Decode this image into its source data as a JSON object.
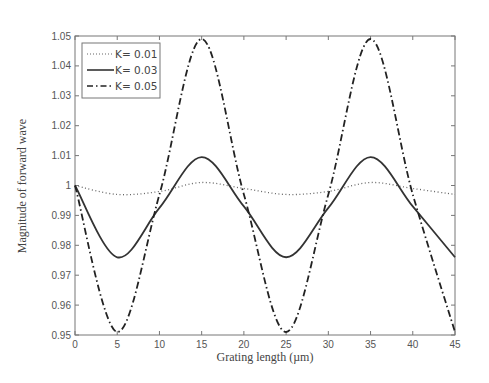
{
  "chart_data": {
    "type": "line",
    "title": "",
    "xlabel": "Grating length (µm)",
    "ylabel": "Magnitude of forward wave",
    "xlim": [
      0,
      45
    ],
    "ylim": [
      0.95,
      1.05
    ],
    "x_ticks": [
      "0",
      "5",
      "10",
      "15",
      "20",
      "25",
      "30",
      "35",
      "40",
      "45"
    ],
    "y_ticks": [
      "0.95",
      "0.96",
      "0.97",
      "0.98",
      "0.99",
      "1",
      "1.01",
      "1.02",
      "1.03",
      "1.04",
      "1.05"
    ],
    "grid": false,
    "legend_position": "upper-left",
    "x": [
      0,
      5,
      10,
      15,
      20,
      25,
      30,
      35,
      40,
      45
    ],
    "series": [
      {
        "name": "K= 0.01",
        "style": "dotted",
        "color": "#555555",
        "values": [
          1.0,
          0.997,
          0.998,
          1.001,
          0.999,
          0.997,
          0.998,
          1.001,
          0.999,
          0.997
        ]
      },
      {
        "name": "K= 0.03",
        "style": "solid",
        "color": "#333333",
        "values": [
          1.0,
          0.976,
          0.9925,
          1.0095,
          0.993,
          0.976,
          0.9925,
          1.0095,
          0.993,
          0.976
        ]
      },
      {
        "name": "K= 0.05",
        "style": "dash-dot",
        "color": "#222222",
        "values": [
          1.0,
          0.951,
          0.997,
          1.049,
          0.997,
          0.951,
          0.997,
          1.049,
          0.997,
          0.951
        ]
      }
    ]
  }
}
